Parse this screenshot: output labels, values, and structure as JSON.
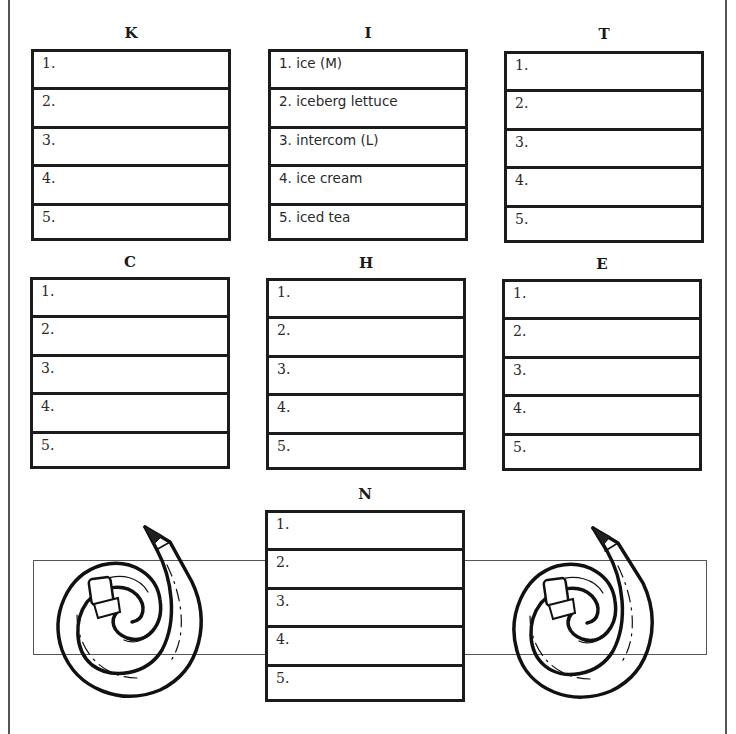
{
  "worksheet": {
    "boxes": [
      {
        "letter": "K",
        "items": [
          "1.",
          "2.",
          "3.",
          "4.",
          "5."
        ]
      },
      {
        "letter": "I",
        "items": [
          "1. ice (M)",
          "2. iceberg lettuce",
          "3. intercom (L)",
          "4. ice cream",
          "5. iced tea"
        ]
      },
      {
        "letter": "T",
        "items": [
          "1.",
          "2.",
          "3.",
          "4.",
          "5."
        ]
      },
      {
        "letter": "C",
        "items": [
          "1.",
          "2.",
          "3.",
          "4.",
          "5."
        ]
      },
      {
        "letter": "H",
        "items": [
          "1.",
          "2.",
          "3.",
          "4.",
          "5."
        ]
      },
      {
        "letter": "E",
        "items": [
          "1.",
          "2.",
          "3.",
          "4.",
          "5."
        ]
      },
      {
        "letter": "N",
        "items": [
          "1.",
          "2.",
          "3.",
          "4.",
          "5."
        ]
      }
    ],
    "decorations": {
      "left_icon": "curled-pencil-icon",
      "right_icon": "curled-pencil-icon"
    },
    "colors": {
      "ink": "#1c1c1c",
      "paper": "#ffffff",
      "frame": "#555555"
    }
  }
}
